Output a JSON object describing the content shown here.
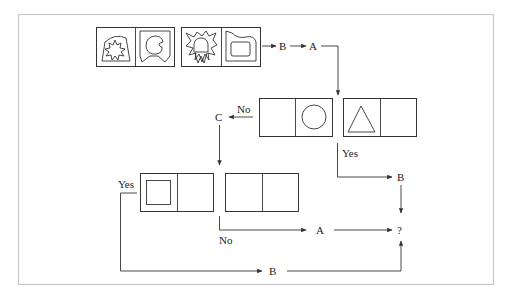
{
  "diagram": {
    "type": "flowchart-puzzle",
    "colors": {
      "stroke": "#333333",
      "frame": "#c8c8c8",
      "background": "#ffffff"
    },
    "top_row": {
      "pairs": [
        {
          "left_figure": "bell-with-starburst-icon",
          "right_figure": "bell-with-notched-circle-icon"
        },
        {
          "left_figure": "starburst-with-bell-and-w-icon",
          "right_figure": "tab-with-rounded-square-icon"
        }
      ],
      "operations": [
        "B",
        "A"
      ]
    },
    "middle_row": {
      "pairs": [
        {
          "left_figure": "empty",
          "right_figure": "circle-icon"
        },
        {
          "left_figure": "triangle-icon",
          "right_figure": "empty"
        }
      ],
      "no_label": "No",
      "no_target": "C",
      "yes_label": "Yes",
      "yes_target": "B"
    },
    "bottom_row": {
      "pairs": [
        {
          "left_figure": "square-icon",
          "right_figure": "empty"
        },
        {
          "left_figure": "empty",
          "right_figure": "empty"
        }
      ],
      "yes_label": "Yes",
      "yes_target": "B",
      "no_label": "No",
      "no_target": "A"
    },
    "result": "?"
  }
}
